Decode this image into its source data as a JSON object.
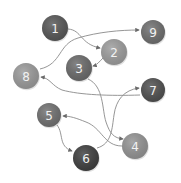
{
  "diagram": {
    "type": "directed-graph",
    "nodes": [
      {
        "id": "1",
        "label": "1",
        "x": 55,
        "y": 28,
        "r": 13,
        "color": "#565656"
      },
      {
        "id": "2",
        "label": "2",
        "x": 114,
        "y": 52,
        "r": 13,
        "color": "#9c9c9c"
      },
      {
        "id": "3",
        "label": "3",
        "x": 79,
        "y": 68,
        "r": 13,
        "color": "#6a6a6a"
      },
      {
        "id": "9",
        "label": "9",
        "x": 153,
        "y": 32,
        "r": 12,
        "color": "#6e6e6e"
      },
      {
        "id": "8",
        "label": "8",
        "x": 26,
        "y": 76,
        "r": 13,
        "color": "#9a9a9a"
      },
      {
        "id": "7",
        "label": "7",
        "x": 153,
        "y": 90,
        "r": 12,
        "color": "#4f4f4f"
      },
      {
        "id": "5",
        "label": "5",
        "x": 49,
        "y": 115,
        "r": 12,
        "color": "#707070"
      },
      {
        "id": "4",
        "label": "4",
        "x": 135,
        "y": 146,
        "r": 13,
        "color": "#939393"
      },
      {
        "id": "6",
        "label": "6",
        "x": 86,
        "y": 158,
        "r": 13,
        "color": "#3e3e3e"
      }
    ],
    "edges": [
      {
        "from": "1",
        "to": "2"
      },
      {
        "from": "8",
        "to": "9"
      },
      {
        "from": "2",
        "to": "3"
      },
      {
        "from": "7",
        "to": "8"
      },
      {
        "from": "3",
        "to": "4"
      },
      {
        "from": "6",
        "to": "7"
      },
      {
        "from": "4",
        "to": "5"
      },
      {
        "from": "5",
        "to": "6"
      }
    ]
  }
}
